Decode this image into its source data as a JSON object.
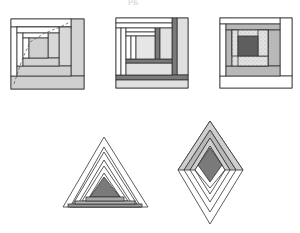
{
  "page": {
    "top_fragment": "pg"
  },
  "colors": {
    "stroke": "#333333",
    "white": "#ffffff",
    "light_gray": "#d6d6d6",
    "mid_gray": "#b8b8b8",
    "dark_gray": "#7a7a7a",
    "darker_gray": "#5e5e5e",
    "speckle": "#e6e6e6"
  },
  "figures": [
    {
      "name": "log-cabin-block-1",
      "type": "square-block"
    },
    {
      "name": "log-cabin-block-2",
      "type": "square-block"
    },
    {
      "name": "log-cabin-block-3",
      "type": "square-block"
    },
    {
      "name": "triangle-log-cabin",
      "type": "triangle-block"
    },
    {
      "name": "diamond-log-cabin",
      "type": "diamond-block"
    }
  ]
}
